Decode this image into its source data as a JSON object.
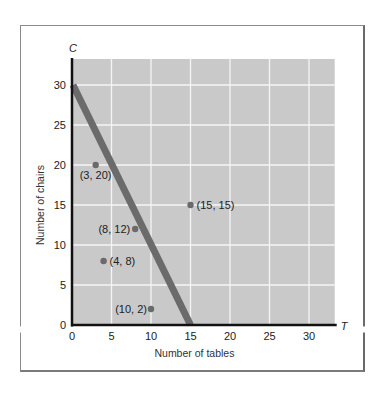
{
  "chart_data": {
    "type": "scatter",
    "title": "",
    "xlabel": "Number of tables",
    "ylabel": "Number of chairs",
    "x_axis_symbol": "T",
    "y_axis_symbol": "C",
    "xlim": [
      0,
      33
    ],
    "ylim": [
      0,
      33
    ],
    "x_ticks": [
      0,
      5,
      10,
      15,
      20,
      25,
      30
    ],
    "y_ticks": [
      0,
      5,
      10,
      15,
      20,
      25,
      30
    ],
    "grid": true,
    "points": [
      {
        "x": 3,
        "y": 20,
        "label": "(3, 20)"
      },
      {
        "x": 15,
        "y": 15,
        "label": "(15, 15)"
      },
      {
        "x": 8,
        "y": 12,
        "label": "(8, 12)"
      },
      {
        "x": 4,
        "y": 8,
        "label": "(4, 8)"
      },
      {
        "x": 10,
        "y": 2,
        "label": "(10, 2)"
      }
    ],
    "lines": [
      {
        "name": "2T + C = 30",
        "from": [
          0,
          30
        ],
        "to": [
          15,
          0
        ]
      }
    ],
    "colors": {
      "plot_background": "#c9c9c9",
      "grid": "#f4f4f4",
      "line": "#6b6b6b",
      "points": "#6a6a6a",
      "axes": "#111111"
    }
  }
}
